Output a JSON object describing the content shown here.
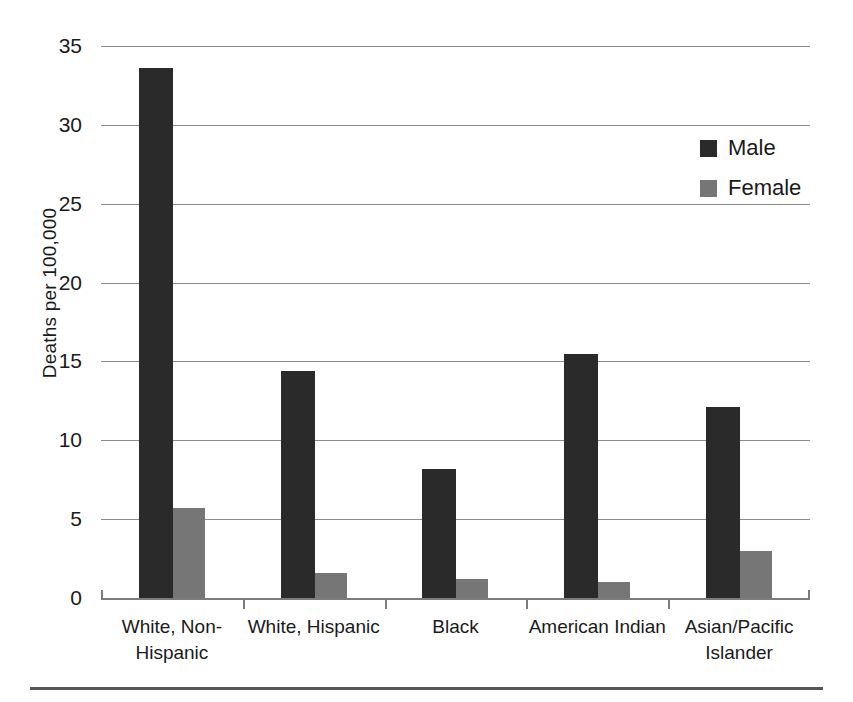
{
  "chart_data": {
    "type": "bar",
    "title": "",
    "xlabel": "",
    "ylabel": "Deaths per 100,000",
    "ylim": [
      0,
      35
    ],
    "ytick_labels": [
      "35",
      "30",
      "25",
      "20",
      "15",
      "10",
      "5",
      "0"
    ],
    "ytick_values": [
      35,
      30,
      25,
      20,
      15,
      10,
      5,
      0
    ],
    "grid": true,
    "legend_position": "top-right",
    "categories": [
      "White, Non-Hispanic",
      "White, Hispanic",
      "Black",
      "American Indian",
      "Asian/Pacific Islander"
    ],
    "category_label_lines": [
      [
        "White, Non-",
        "Hispanic"
      ],
      [
        "White, Hispanic",
        ""
      ],
      [
        "Black",
        ""
      ],
      [
        "American Indian",
        ""
      ],
      [
        "Asian/Pacific",
        "Islander"
      ]
    ],
    "series": [
      {
        "name": "Male",
        "color": "#2a2a2a",
        "values": [
          33.6,
          14.4,
          8.2,
          15.5,
          12.1
        ]
      },
      {
        "name": "Female",
        "color": "#767676",
        "values": [
          5.7,
          1.6,
          1.2,
          1.0,
          3.0
        ]
      }
    ]
  },
  "legend": {
    "items": [
      {
        "label": "Male",
        "color": "#2a2a2a"
      },
      {
        "label": "Female",
        "color": "#767676"
      }
    ]
  },
  "axis": {
    "y_title": "Deaths per 100,000"
  }
}
